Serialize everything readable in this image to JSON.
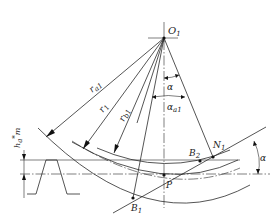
{
  "diagram": {
    "colors": {
      "line": "#2a2a2a",
      "text": "#222222",
      "background": "#ffffff"
    },
    "labels": {
      "center": "O",
      "center_sub": "1",
      "ra1": "r",
      "ra1_sub": "a1",
      "r1": "r",
      "r1_sub": "1",
      "rb1": "r",
      "rb1_sub": "b1",
      "alpha": "α",
      "alpha_a1": "α",
      "alpha_a1_sub": "a1",
      "N1": "N",
      "N1_sub": "1",
      "B2": "B",
      "B2_sub": "2",
      "B1": "B",
      "B1_sub": "1",
      "P": "P",
      "alpha_right": "α",
      "addendum": "h",
      "addendum_sup": "*",
      "addendum_sub": "a",
      "addendum_m": "m"
    },
    "points": [
      {
        "name": "O1",
        "x": 164,
        "y": 38
      },
      {
        "name": "P",
        "x": 164,
        "y": 175
      },
      {
        "name": "B1",
        "x": 133,
        "y": 198
      },
      {
        "name": "B2",
        "x": 200,
        "y": 161
      },
      {
        "name": "N1",
        "x": 213,
        "y": 157
      }
    ],
    "circles": [
      "addendum circle r_a1",
      "pitch circle r_1",
      "base circle r_b1"
    ]
  }
}
